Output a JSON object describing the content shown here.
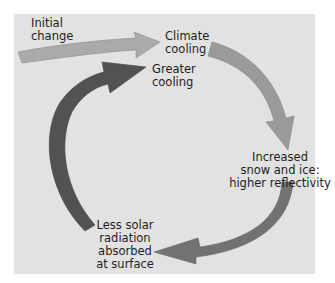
{
  "diagram": {
    "type": "feedback-loop",
    "background_color": "#e2e2e2",
    "labels": {
      "initial_change": [
        "Initial",
        "change"
      ],
      "climate_cooling": [
        "Climate",
        "cooling"
      ],
      "greater_cooling": [
        "Greater",
        "cooling"
      ],
      "increased_snow_ice": [
        "Increased",
        "snow and ice:",
        "higher reflectivity"
      ],
      "less_solar_radiation": [
        "Less solar",
        "radiation",
        "absorbed",
        "at surface"
      ]
    },
    "arrows": [
      {
        "from": "Initial change",
        "to": "Climate cooling",
        "color": "#aaaaaa"
      },
      {
        "from": "Climate cooling",
        "to": "Increased snow and ice: higher reflectivity",
        "color": "#9a9a9a"
      },
      {
        "from": "Increased snow and ice: higher reflectivity",
        "to": "Less solar radiation absorbed at surface",
        "color": "#707070"
      },
      {
        "from": "Less solar radiation absorbed at surface",
        "to": "Greater cooling",
        "color": "#505050"
      }
    ]
  }
}
